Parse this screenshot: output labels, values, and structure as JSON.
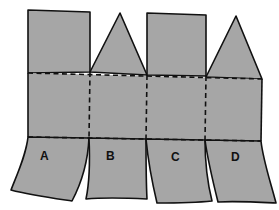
{
  "diagram": {
    "type": "net",
    "colors": {
      "fill": "#a6a6a6",
      "outline": "#111111",
      "background": "#ffffff"
    },
    "top_flaps": [
      {
        "column": 1,
        "shape": "square"
      },
      {
        "column": 2,
        "shape": "triangle"
      },
      {
        "column": 3,
        "shape": "square"
      },
      {
        "column": 4,
        "shape": "triangle"
      }
    ],
    "fold_lines": {
      "style": "dashed",
      "horizontal_count": 2,
      "vertical_count": 3
    },
    "labels": [
      {
        "id": "A",
        "text": "A"
      },
      {
        "id": "B",
        "text": "B"
      },
      {
        "id": "C",
        "text": "C"
      },
      {
        "id": "D",
        "text": "D"
      }
    ]
  }
}
